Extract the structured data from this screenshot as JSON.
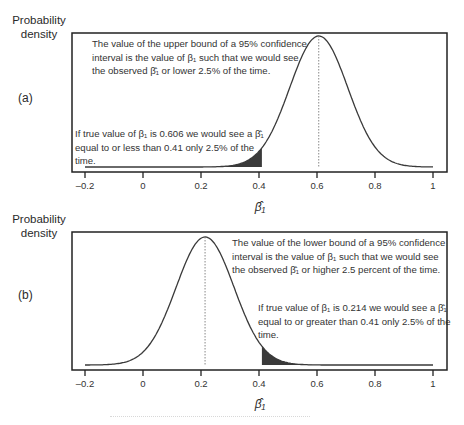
{
  "chart_data": [
    {
      "type": "area",
      "panel": "(a)",
      "title": "",
      "ylabel": "Probability density",
      "xlabel": "β̂1",
      "xlim": [
        -0.2,
        1.0
      ],
      "xticks": [
        -0.2,
        0,
        0.2,
        0.4,
        0.6,
        0.8,
        1
      ],
      "xtick_labels": [
        "–0.2",
        "0",
        "0.2",
        "0.4",
        "0.6",
        "0.8",
        "1"
      ],
      "distribution": {
        "kind": "normal",
        "mean": 0.606,
        "sd": 0.1
      },
      "shaded_region": {
        "from": -0.2,
        "to": 0.41,
        "tail": "lower",
        "probability": 0.025
      },
      "reference_line": {
        "x": 0.606,
        "style": "dotted"
      },
      "annotations": [
        "The value of the upper bound of a 95% confidence interval is the value of β1 such that we would see the observed β̂1 or lower 2.5% of the time.",
        "If true value of β1 is 0.606 we would see a β̂1 equal to or less than 0.41 only 2.5% of the time."
      ],
      "grid": false
    },
    {
      "type": "area",
      "panel": "(b)",
      "title": "",
      "ylabel": "Probability density",
      "xlabel": "β̂1",
      "xlim": [
        -0.2,
        1.0
      ],
      "xticks": [
        -0.2,
        0,
        0.2,
        0.4,
        0.6,
        0.8,
        1
      ],
      "xtick_labels": [
        "–0.2",
        "0",
        "0.2",
        "0.4",
        "0.6",
        "0.8",
        "1"
      ],
      "distribution": {
        "kind": "normal",
        "mean": 0.214,
        "sd": 0.1
      },
      "shaded_region": {
        "from": 0.41,
        "to": 1.0,
        "tail": "upper",
        "probability": 0.025
      },
      "reference_line": {
        "x": 0.214,
        "style": "dotted"
      },
      "annotations": [
        "The value of the lower bound of a 95% confidence interval is the value of β1 such that we would see the observed β̂1 or higher 2.5 percent of the time.",
        "If true value of β1 is 0.214 we would see a β̂1 equal to or greater than 0.41 only 2.5% of the time."
      ],
      "grid": false
    }
  ],
  "panel_a": {
    "ylabel_line1": "Probability",
    "ylabel_line2": "density",
    "label": "(a)",
    "note_top": [
      "The value of the upper bound of a 95% confidence",
      "interval is the value of β₁ such that we would see",
      "the observed β̂₁ or lower 2.5% of the time."
    ],
    "note_bottom": [
      "If true value of β₁ is 0.606 we would see a β̂₁",
      "equal to or less than 0.41 only 2.5% of the",
      "time."
    ],
    "xlabel": "β̂₁",
    "ticks": [
      "–0.2",
      "0",
      "0.2",
      "0.4",
      "0.6",
      "0.8",
      "1"
    ]
  },
  "panel_b": {
    "ylabel_line1": "Probability",
    "ylabel_line2": "density",
    "label": "(b)",
    "note_top": [
      "The value of the lower bound of a 95% confidence",
      "interval is the value of β₁ such that we would see",
      "the observed β̂₁ or higher 2.5 percent of the time."
    ],
    "note_bottom": [
      "If true value of β₁ is 0.214 we would see a β̂₁",
      "equal to or greater than 0.41 only 2.5% of the",
      "time."
    ],
    "xlabel": "β̂₁",
    "ticks": [
      "–0.2",
      "0",
      "0.2",
      "0.4",
      "0.6",
      "0.8",
      "1"
    ]
  },
  "colors": {
    "curve": "#3a3a3a",
    "shade": "#3a3a3a",
    "frame": "#222222",
    "dotted": "#888888"
  }
}
